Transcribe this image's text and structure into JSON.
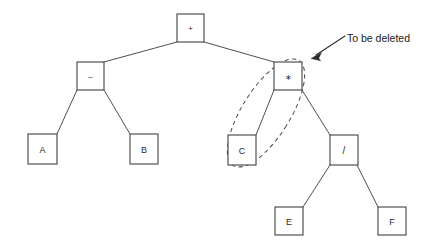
{
  "diagram": {
    "background_color": "#ffffff",
    "node_stroke_color": "#4a4a4a",
    "edge_stroke_color": "#3b3b3b",
    "selection_stroke_color": "#4a4a4a",
    "annotation_color": "#1a1a1a",
    "nodes": [
      {
        "id": "root",
        "label": "+",
        "kind": "operator",
        "x": 177,
        "y": 14,
        "w": 27,
        "h": 28
      },
      {
        "id": "minus",
        "label": "–",
        "kind": "operator",
        "x": 77,
        "y": 62,
        "w": 27,
        "h": 28
      },
      {
        "id": "times",
        "label": "∗",
        "kind": "operator",
        "x": 274,
        "y": 62,
        "w": 28,
        "h": 28
      },
      {
        "id": "a",
        "label": "A",
        "kind": "operand",
        "x": 28,
        "y": 134,
        "w": 29,
        "h": 30
      },
      {
        "id": "b",
        "label": "B",
        "kind": "operand",
        "x": 130,
        "y": 134,
        "w": 28,
        "h": 30
      },
      {
        "id": "c",
        "label": "C",
        "kind": "operand",
        "x": 228,
        "y": 135,
        "w": 28,
        "h": 30
      },
      {
        "id": "divide",
        "label": "/",
        "kind": "operator",
        "x": 330,
        "y": 135,
        "w": 28,
        "h": 30
      },
      {
        "id": "e",
        "label": "E",
        "kind": "operand",
        "x": 275,
        "y": 207,
        "w": 28,
        "h": 28
      },
      {
        "id": "f",
        "label": "F",
        "kind": "operand",
        "x": 378,
        "y": 207,
        "w": 28,
        "h": 28
      }
    ],
    "edges": [
      {
        "id": "root-minus",
        "from": "root",
        "to": "minus",
        "x1": 177,
        "y1": 42,
        "x2": 104,
        "y2": 62
      },
      {
        "id": "root-times",
        "from": "root",
        "to": "times",
        "x1": 204,
        "y1": 42,
        "x2": 274,
        "y2": 62
      },
      {
        "id": "minus-a",
        "from": "minus",
        "to": "a",
        "x1": 77,
        "y1": 90,
        "x2": 57,
        "y2": 134
      },
      {
        "id": "minus-b",
        "from": "minus",
        "to": "b",
        "x1": 104,
        "y1": 90,
        "x2": 130,
        "y2": 134
      },
      {
        "id": "times-c",
        "from": "times",
        "to": "c",
        "x1": 274,
        "y1": 90,
        "x2": 256,
        "y2": 135
      },
      {
        "id": "times-divide",
        "from": "times",
        "to": "divide",
        "x1": 302,
        "y1": 90,
        "x2": 330,
        "y2": 135
      },
      {
        "id": "divide-e",
        "from": "divide",
        "to": "e",
        "x1": 330,
        "y1": 165,
        "x2": 303,
        "y2": 207
      },
      {
        "id": "divide-f",
        "from": "divide",
        "to": "f",
        "x1": 357,
        "y1": 165,
        "x2": 378,
        "y2": 207
      }
    ],
    "selection": {
      "id": "deletion-selection",
      "shape": "rotated-capsule",
      "encloses": [
        "times",
        "c"
      ],
      "cx": 266,
      "cy": 113,
      "rx": 24,
      "ry": 62,
      "rotation_deg": 32
    },
    "annotation": {
      "id": "to-be-deleted",
      "text": "To be deleted",
      "text_x": 347,
      "text_y": 42,
      "leader_x1": 345,
      "leader_y1": 36,
      "leader_x2": 313,
      "leader_y2": 57,
      "arrow_target": "times"
    }
  }
}
